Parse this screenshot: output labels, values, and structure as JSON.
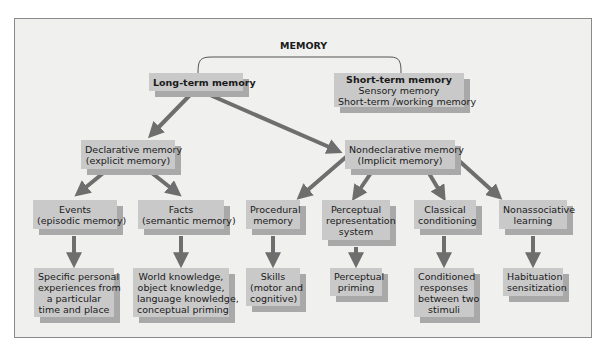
{
  "diagram": {
    "title": "MEMORY",
    "nodes": {
      "long_term": {
        "lines": [
          "Long-term memory"
        ]
      },
      "short_term": {
        "lines": [
          "Short-term memory",
          "Sensory memory",
          "Short-term /working memory"
        ]
      },
      "declarative": {
        "lines": [
          "Declarative memory",
          "(explicit memory)"
        ]
      },
      "nondeclarative": {
        "lines": [
          "Nondeclarative memory",
          "(Implicit memory)"
        ]
      },
      "events": {
        "lines": [
          "Events",
          "(episodic memory)"
        ]
      },
      "facts": {
        "lines": [
          "Facts",
          "(semantic memory)"
        ]
      },
      "procedural": {
        "lines": [
          "Procedural",
          "memory"
        ]
      },
      "perceptual_rep": {
        "lines": [
          "Perceptual",
          "representation",
          "system"
        ]
      },
      "classical": {
        "lines": [
          "Classical",
          "conditioning"
        ]
      },
      "nonassociative": {
        "lines": [
          "Nonassociative",
          "learning"
        ]
      },
      "events_desc": {
        "lines": [
          "Specific personal",
          "experiences from",
          "a particular",
          "time and place"
        ]
      },
      "facts_desc": {
        "lines": [
          "World knowledge,",
          "object knowledge,",
          "language knowledge,",
          "conceptual priming"
        ]
      },
      "procedural_desc": {
        "lines": [
          "Skills",
          "(motor and",
          "cognitive)"
        ]
      },
      "perceptual_desc": {
        "lines": [
          "Perceptual",
          "priming"
        ]
      },
      "classical_desc": {
        "lines": [
          "Conditioned",
          "responses",
          "between two",
          "stimuli"
        ]
      },
      "nonassociative_desc": {
        "lines": [
          "Habituation",
          "sensitization"
        ]
      }
    },
    "colors": {
      "box": "#c9c9c9",
      "shadow": "#a9a9a9",
      "arrow": "#6e6e6e",
      "background": "#f0f0ef",
      "frame": "#8a8a8a"
    }
  }
}
